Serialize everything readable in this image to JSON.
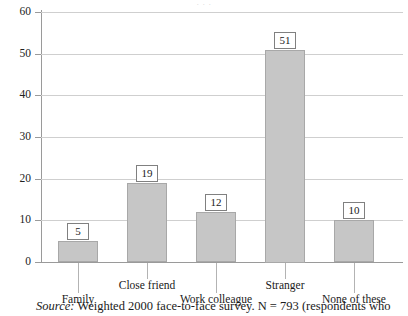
{
  "figure": {
    "top_clipped_text": "· · ·",
    "source_label": "Source:",
    "source_text": "Weighted 2000 face-to-face survey. N = 793 (respondents who"
  },
  "chart_data": {
    "type": "bar",
    "title": "",
    "subtitle": "",
    "xlabel": "",
    "ylabel": "",
    "categories": [
      "Family",
      "Close friend",
      "Work colleague",
      "Stranger",
      "None of these"
    ],
    "values": [
      5,
      19,
      12,
      51,
      10
    ],
    "value_labels": [
      "5",
      "19",
      "12",
      "51",
      "10"
    ],
    "ylim": [
      0,
      60
    ],
    "yticks": [
      0,
      10,
      20,
      30,
      40,
      50,
      60
    ],
    "ytick_labels": [
      "0",
      "10",
      "20",
      "30",
      "40",
      "50",
      "60"
    ],
    "grid": true,
    "legend": null,
    "legend_position": "none",
    "bar_color": "#c6c6c6",
    "bar_border_color": "#a8a8a8",
    "grid_color": "#cfcfcf",
    "axis_color": "#9a9a9a",
    "label_stagger": [
      "lower",
      "upper",
      "lower",
      "upper",
      "lower"
    ],
    "annotations": []
  }
}
